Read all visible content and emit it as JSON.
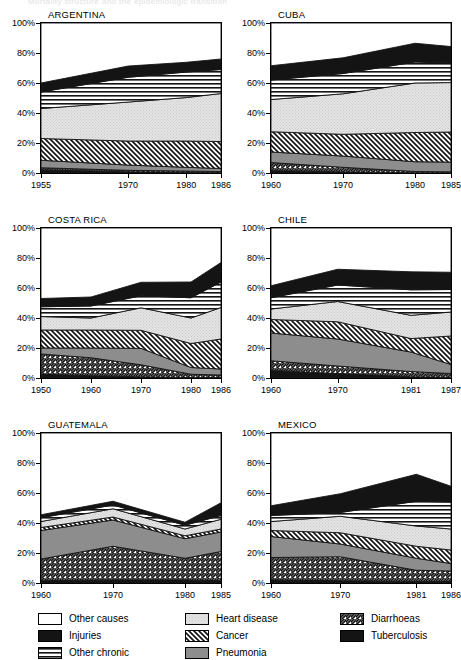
{
  "header": {
    "partial_text": "Mortality structure and the epidemiologic transition"
  },
  "legend": {
    "columns": [
      [
        {
          "label": "Other causes",
          "key": "other_causes"
        },
        {
          "label": "Injuries",
          "key": "injuries"
        },
        {
          "label": "Other chronic",
          "key": "other_chronic"
        }
      ],
      [
        {
          "label": "Heart disease",
          "key": "heart_disease"
        },
        {
          "label": "Cancer",
          "key": "cancer"
        },
        {
          "label": "Pneumonia",
          "key": "pneumonia"
        }
      ],
      [
        {
          "label": "Diarrhoeas",
          "key": "diarrhoeas"
        },
        {
          "label": "Tuberculosis",
          "key": "tuberculosis"
        }
      ]
    ]
  },
  "series_order": [
    "tuberculosis",
    "diarrhoeas",
    "pneumonia",
    "cancer",
    "heart_disease",
    "other_chronic",
    "injuries",
    "other_causes"
  ],
  "fills": {
    "tuberculosis": "black",
    "diarrhoeas": "hatch-forward",
    "pneumonia": "grey",
    "cancer": "hatch-back",
    "heart_disease": "stipple-light",
    "other_chronic": "hlines",
    "injuries": "black",
    "other_causes": "white"
  },
  "colors": {
    "black": "#141414",
    "grey": "#8d8d8d",
    "light_grey": "#dcdcdc",
    "white": "#ffffff",
    "axis": "#000000"
  },
  "chart_data": [
    {
      "type": "area",
      "title": "ARGENTINA",
      "xlabel": "",
      "ylabel": "",
      "x": [
        1955,
        1970,
        1980,
        1986
      ],
      "xticks": [
        "1955",
        "1970",
        "1980",
        "1986"
      ],
      "yticks": [
        "0%",
        "20%",
        "40%",
        "60%",
        "80%",
        "100%"
      ],
      "ylim": [
        0,
        100
      ],
      "stacked": true,
      "grid": false,
      "legend_position": "bottom-shared",
      "series": [
        {
          "name": "Tuberculosis",
          "values": [
            2.0,
            0.8,
            0.5,
            0.4
          ]
        },
        {
          "name": "Diarrhoeas",
          "values": [
            1.5,
            1.0,
            0.8,
            0.6
          ]
        },
        {
          "name": "Pneumonia",
          "values": [
            5.0,
            3.5,
            2.5,
            2.0
          ]
        },
        {
          "name": "Cancer",
          "values": [
            14.5,
            16.0,
            17.5,
            18.0
          ]
        },
        {
          "name": "Heart disease",
          "values": [
            20.0,
            26.0,
            29.0,
            32.0
          ]
        },
        {
          "name": "Other chronic",
          "values": [
            11.0,
            16.5,
            17.0,
            16.0
          ]
        },
        {
          "name": "Injuries",
          "values": [
            6.0,
            7.5,
            6.5,
            7.0
          ]
        },
        {
          "name": "Other causes",
          "values": [
            40.0,
            28.7,
            26.2,
            24.0
          ]
        }
      ]
    },
    {
      "type": "area",
      "title": "CUBA",
      "xlabel": "",
      "ylabel": "",
      "x": [
        1960,
        1970,
        1980,
        1985
      ],
      "xticks": [
        "1960",
        "1970",
        "1980",
        "1985"
      ],
      "yticks": [
        "0%",
        "20%",
        "40%",
        "60%",
        "80%",
        "100%"
      ],
      "ylim": [
        0,
        100
      ],
      "stacked": true,
      "grid": false,
      "legend_position": "bottom-shared",
      "series": [
        {
          "name": "Tuberculosis",
          "values": [
            1.5,
            0.8,
            0.2,
            0.2
          ]
        },
        {
          "name": "Diarrhoeas",
          "values": [
            5.5,
            3.0,
            0.8,
            0.6
          ]
        },
        {
          "name": "Pneumonia",
          "values": [
            7.0,
            7.5,
            6.5,
            6.5
          ]
        },
        {
          "name": "Cancer",
          "values": [
            13.5,
            14.5,
            19.5,
            20.0
          ]
        },
        {
          "name": "Heart disease",
          "values": [
            21.5,
            27.0,
            33.0,
            33.0
          ]
        },
        {
          "name": "Other chronic",
          "values": [
            13.0,
            13.5,
            14.0,
            13.0
          ]
        },
        {
          "name": "Injuries",
          "values": [
            9.5,
            10.5,
            12.5,
            11.0
          ]
        },
        {
          "name": "Other causes",
          "values": [
            28.5,
            23.2,
            13.5,
            15.7
          ]
        }
      ]
    },
    {
      "type": "area",
      "title": "COSTA RICA",
      "xlabel": "",
      "ylabel": "",
      "x": [
        1950,
        1960,
        1970,
        1980,
        1986
      ],
      "xticks": [
        "1950",
        "1960",
        "1970",
        "1980",
        "1986"
      ],
      "yticks": [
        "0%",
        "20%",
        "40%",
        "60%",
        "80%",
        "100%"
      ],
      "ylim": [
        0,
        100
      ],
      "stacked": true,
      "grid": false,
      "legend_position": "bottom-shared",
      "series": [
        {
          "name": "Tuberculosis",
          "values": [
            2.5,
            1.5,
            0.8,
            0.3,
            0.3
          ]
        },
        {
          "name": "Diarrhoeas",
          "values": [
            13.5,
            12.0,
            8.0,
            2.2,
            1.7
          ]
        },
        {
          "name": "Pneumonia",
          "values": [
            4.0,
            6.5,
            11.0,
            4.5,
            4.0
          ]
        },
        {
          "name": "Cancer",
          "values": [
            12.0,
            12.0,
            12.0,
            16.0,
            20.0
          ]
        },
        {
          "name": "Heart disease",
          "values": [
            9.0,
            8.0,
            15.0,
            17.0,
            21.0
          ]
        },
        {
          "name": "Other chronic",
          "values": [
            6.5,
            8.0,
            8.0,
            13.5,
            17.0
          ]
        },
        {
          "name": "Injuries",
          "values": [
            5.5,
            6.0,
            9.0,
            10.5,
            13.0
          ]
        },
        {
          "name": "Other causes",
          "values": [
            47.0,
            46.0,
            36.2,
            36.0,
            23.0
          ]
        }
      ]
    },
    {
      "type": "area",
      "title": "CHILE",
      "xlabel": "",
      "ylabel": "",
      "x": [
        1960,
        1970,
        1981,
        1987
      ],
      "xticks": [
        "1960",
        "1970",
        "1981",
        "1987"
      ],
      "yticks": [
        "0%",
        "20%",
        "40%",
        "60%",
        "80%",
        "100%"
      ],
      "ylim": [
        0,
        100
      ],
      "stacked": true,
      "grid": false,
      "legend_position": "bottom-shared",
      "series": [
        {
          "name": "Tuberculosis",
          "values": [
            5.0,
            3.0,
            0.8,
            0.5
          ]
        },
        {
          "name": "Diarrhoeas",
          "values": [
            6.5,
            5.0,
            3.5,
            2.5
          ]
        },
        {
          "name": "Pneumonia",
          "values": [
            18.5,
            18.0,
            13.0,
            6.0
          ]
        },
        {
          "name": "Cancer",
          "values": [
            9.0,
            11.5,
            9.0,
            19.0
          ]
        },
        {
          "name": "Heart disease",
          "values": [
            7.0,
            13.5,
            15.5,
            16.0
          ]
        },
        {
          "name": "Other chronic",
          "values": [
            7.5,
            11.0,
            17.0,
            15.0
          ]
        },
        {
          "name": "Injuries",
          "values": [
            8.0,
            10.5,
            12.0,
            11.5
          ]
        },
        {
          "name": "Other causes",
          "values": [
            38.5,
            27.5,
            29.2,
            29.5
          ]
        }
      ]
    },
    {
      "type": "area",
      "title": "GUATEMALA",
      "xlabel": "",
      "ylabel": "",
      "x": [
        1960,
        1970,
        1980,
        1985
      ],
      "xticks": [
        "1960",
        "1970",
        "1980",
        "1985"
      ],
      "yticks": [
        "0%",
        "20%",
        "40%",
        "60%",
        "80%",
        "100%"
      ],
      "ylim": [
        0,
        100
      ],
      "stacked": true,
      "grid": false,
      "legend_position": "bottom-shared",
      "series": [
        {
          "name": "Tuberculosis",
          "values": [
            1.5,
            2.0,
            2.0,
            1.5
          ]
        },
        {
          "name": "Diarrhoeas",
          "values": [
            14.5,
            22.5,
            14.5,
            19.5
          ]
        },
        {
          "name": "Pneumonia",
          "values": [
            19.0,
            17.5,
            13.0,
            13.0
          ]
        },
        {
          "name": "Cancer",
          "values": [
            2.0,
            2.0,
            2.0,
            2.0
          ]
        },
        {
          "name": "Heart disease",
          "values": [
            4.0,
            5.5,
            4.5,
            6.5
          ]
        },
        {
          "name": "Other chronic",
          "values": [
            2.5,
            2.5,
            2.5,
            2.5
          ]
        },
        {
          "name": "Injuries",
          "values": [
            2.0,
            2.5,
            2.0,
            8.5
          ]
        },
        {
          "name": "Other causes",
          "values": [
            54.5,
            45.5,
            59.5,
            46.5
          ]
        }
      ]
    },
    {
      "type": "area",
      "title": "MEXICO",
      "xlabel": "",
      "ylabel": "",
      "x": [
        1960,
        1970,
        1981,
        1986
      ],
      "xticks": [
        "1960",
        "1970",
        "1981",
        "1986"
      ],
      "yticks": [
        "0%",
        "20%",
        "40%",
        "60%",
        "80%",
        "100%"
      ],
      "ylim": [
        0,
        100
      ],
      "stacked": true,
      "grid": false,
      "legend_position": "bottom-shared",
      "series": [
        {
          "name": "Tuberculosis",
          "values": [
            2.0,
            1.5,
            1.0,
            1.0
          ]
        },
        {
          "name": "Diarrhoeas",
          "values": [
            15.0,
            16.0,
            7.5,
            7.0
          ]
        },
        {
          "name": "Pneumonia",
          "values": [
            14.0,
            8.5,
            8.0,
            5.0
          ]
        },
        {
          "name": "Cancer",
          "values": [
            4.0,
            7.5,
            8.0,
            9.0
          ]
        },
        {
          "name": "Heart disease",
          "values": [
            6.0,
            11.0,
            13.5,
            14.0
          ]
        },
        {
          "name": "Other chronic",
          "values": [
            4.0,
            2.5,
            16.5,
            18.0
          ]
        },
        {
          "name": "Injuries",
          "values": [
            6.5,
            12.5,
            18.0,
            10.5
          ]
        },
        {
          "name": "Other causes",
          "values": [
            48.5,
            40.5,
            27.5,
            35.5
          ]
        }
      ]
    }
  ]
}
